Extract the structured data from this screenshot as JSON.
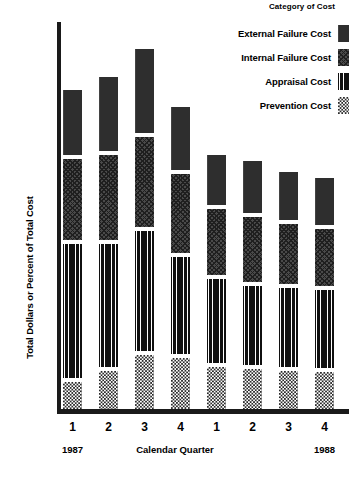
{
  "legend": {
    "title": "Category of Cost",
    "items": [
      {
        "label": "External Failure Cost",
        "pattern": "solid-dark",
        "key": "external"
      },
      {
        "label": "Internal Failure Cost",
        "pattern": "diagonal-crosshatch",
        "key": "internal"
      },
      {
        "label": "Appraisal Cost",
        "pattern": "vertical-lines",
        "key": "appraisal"
      },
      {
        "label": "Prevention Cost",
        "pattern": "checkerboard",
        "key": "prevention"
      }
    ]
  },
  "axes": {
    "y_title": "Total Dollars or Percent of Total Cost",
    "x_title": "Calendar Quarter",
    "x_ticks": [
      "1",
      "2",
      "3",
      "4",
      "1",
      "2",
      "3",
      "4"
    ],
    "year_left": "1987",
    "year_right": "1988"
  },
  "colors": {
    "axis": "#1a1a1a",
    "external": "#2e2e2e",
    "internal": "#4a4a4a",
    "appraisal": "#3a3a3a",
    "prevention": "#2a2a2a",
    "background": "#ffffff"
  },
  "chart_data": {
    "type": "bar",
    "subtype": "stacked",
    "title": "",
    "xlabel": "Calendar Quarter",
    "ylabel": "Total Dollars or Percent of Total Cost",
    "categories": [
      "1987 Q1",
      "1987 Q2",
      "1987 Q3",
      "1987 Q4",
      "1988 Q1",
      "1988 Q2",
      "1988 Q3",
      "1988 Q4"
    ],
    "tick_labels": [
      "1",
      "2",
      "3",
      "4",
      "1",
      "2",
      "3",
      "4"
    ],
    "stack_order_bottom_to_top": [
      "Prevention Cost",
      "Appraisal Cost",
      "Internal Failure Cost",
      "External Failure Cost"
    ],
    "legend_position": "top-right",
    "grid": false,
    "ylim": [
      0,
      100
    ],
    "units": "percent of total cost (unlabeled axis)",
    "series": [
      {
        "name": "Prevention Cost",
        "values": [
          7,
          9,
          11,
          13,
          14,
          15,
          16,
          17
        ]
      },
      {
        "name": "Appraisal Cost",
        "values": [
          34,
          32,
          31,
          28,
          27,
          26,
          25,
          24
        ]
      },
      {
        "name": "Internal Failure Cost",
        "values": [
          20,
          21,
          22,
          19,
          16,
          15,
          13,
          12
        ]
      },
      {
        "name": "External Failure Cost",
        "values": [
          17,
          20,
          23,
          15,
          11,
          10,
          9,
          8
        ]
      }
    ],
    "totals": [
      78,
      82,
      87,
      75,
      68,
      66,
      63,
      61
    ]
  },
  "bar_geometry": {
    "note": "pixel layout used for rendering; top/height per segment in px from plot top",
    "baseline_y": 409,
    "bar_width": 19,
    "first_bar_x": 63,
    "bar_pitch": 36,
    "bars": [
      {
        "x": 63,
        "segments": [
          {
            "key": "external",
            "top": 90,
            "h": 65
          },
          {
            "key": "internal",
            "top": 159,
            "h": 81
          },
          {
            "key": "appraisal",
            "top": 244,
            "h": 134
          },
          {
            "key": "prevention",
            "top": 382,
            "h": 27
          }
        ]
      },
      {
        "x": 99,
        "segments": [
          {
            "key": "external",
            "top": 77,
            "h": 74
          },
          {
            "key": "internal",
            "top": 155,
            "h": 85
          },
          {
            "key": "appraisal",
            "top": 244,
            "h": 123
          },
          {
            "key": "prevention",
            "top": 371,
            "h": 38
          }
        ]
      },
      {
        "x": 135,
        "segments": [
          {
            "key": "external",
            "top": 49,
            "h": 84
          },
          {
            "key": "internal",
            "top": 137,
            "h": 90
          },
          {
            "key": "appraisal",
            "top": 231,
            "h": 120
          },
          {
            "key": "prevention",
            "top": 355,
            "h": 54
          }
        ]
      },
      {
        "x": 171,
        "segments": [
          {
            "key": "external",
            "top": 107,
            "h": 63
          },
          {
            "key": "internal",
            "top": 174,
            "h": 79
          },
          {
            "key": "appraisal",
            "top": 257,
            "h": 97
          },
          {
            "key": "prevention",
            "top": 358,
            "h": 51
          }
        ]
      },
      {
        "x": 207,
        "segments": [
          {
            "key": "external",
            "top": 155,
            "h": 50
          },
          {
            "key": "internal",
            "top": 209,
            "h": 66
          },
          {
            "key": "appraisal",
            "top": 279,
            "h": 84
          },
          {
            "key": "prevention",
            "top": 367,
            "h": 42
          }
        ]
      },
      {
        "x": 243,
        "segments": [
          {
            "key": "external",
            "top": 161,
            "h": 52
          },
          {
            "key": "internal",
            "top": 217,
            "h": 65
          },
          {
            "key": "appraisal",
            "top": 286,
            "h": 79
          },
          {
            "key": "prevention",
            "top": 369,
            "h": 40
          }
        ]
      },
      {
        "x": 279,
        "segments": [
          {
            "key": "external",
            "top": 172,
            "h": 48
          },
          {
            "key": "internal",
            "top": 224,
            "h": 60
          },
          {
            "key": "appraisal",
            "top": 288,
            "h": 79
          },
          {
            "key": "prevention",
            "top": 371,
            "h": 38
          }
        ]
      },
      {
        "x": 315,
        "segments": [
          {
            "key": "external",
            "top": 178,
            "h": 47
          },
          {
            "key": "internal",
            "top": 229,
            "h": 57
          },
          {
            "key": "appraisal",
            "top": 290,
            "h": 78
          },
          {
            "key": "prevention",
            "top": 372,
            "h": 37
          }
        ]
      }
    ]
  }
}
